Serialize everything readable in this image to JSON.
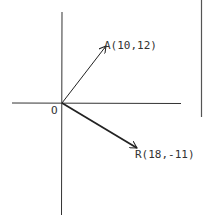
{
  "diagram": {
    "origin_label": "O",
    "vectors": [
      {
        "name": "A",
        "x": 10,
        "y": 12,
        "label": "A(10,12)"
      },
      {
        "name": "R",
        "x": 18,
        "y": -11,
        "label": "R(18,-11)"
      }
    ],
    "colors": {
      "ink": "#222222",
      "border": "#555555"
    }
  }
}
